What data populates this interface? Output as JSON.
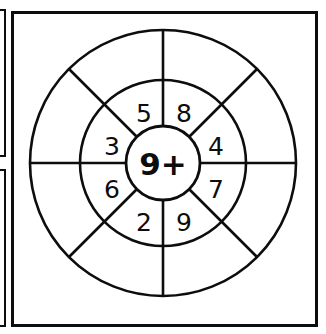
{
  "worksheet": {
    "type": "math-fact-wheel",
    "colors": {
      "ink": "#0d0d0d",
      "paper": "#ffffff"
    },
    "hub": {
      "label": "9+",
      "operand": "9",
      "operator": "+"
    },
    "geometry": {
      "center_x": 163,
      "center_y": 163,
      "outer_radius": 133,
      "middle_radius": 83,
      "inner_radius": 37,
      "sector_count": 8,
      "spoke_angles_deg": [
        0,
        45,
        90,
        135,
        180,
        225,
        270,
        315
      ]
    },
    "inner_ring_sectors": [
      {
        "position": "top-left",
        "label": "5",
        "angle_deg": 247.5,
        "x": 144,
        "y": 113
      },
      {
        "position": "top-right",
        "label": "8",
        "angle_deg": 292.5,
        "x": 184,
        "y": 113
      },
      {
        "position": "left-upper",
        "label": "3",
        "angle_deg": 202.5,
        "x": 112,
        "y": 146
      },
      {
        "position": "right-upper",
        "label": "4",
        "angle_deg": 337.5,
        "x": 216,
        "y": 146
      },
      {
        "position": "left-lower",
        "label": "6",
        "angle_deg": 157.5,
        "x": 112,
        "y": 189
      },
      {
        "position": "right-lower",
        "label": "7",
        "angle_deg": 22.5,
        "x": 216,
        "y": 189
      },
      {
        "position": "bottom-left",
        "label": "2",
        "angle_deg": 112.5,
        "x": 144,
        "y": 222
      },
      {
        "position": "bottom-right",
        "label": "9",
        "angle_deg": 67.5,
        "x": 184,
        "y": 222
      }
    ],
    "outer_ring_sectors": [
      {
        "position": "top-left",
        "label": ""
      },
      {
        "position": "top-right",
        "label": ""
      },
      {
        "position": "left-upper",
        "label": ""
      },
      {
        "position": "right-upper",
        "label": ""
      },
      {
        "position": "left-lower",
        "label": ""
      },
      {
        "position": "right-lower",
        "label": ""
      },
      {
        "position": "bottom-left",
        "label": ""
      },
      {
        "position": "bottom-right",
        "label": ""
      }
    ],
    "edge_fragments": [
      {
        "name": "left-neighbour-upper",
        "visible": true
      },
      {
        "name": "left-neighbour-lower",
        "visible": true
      }
    ]
  }
}
